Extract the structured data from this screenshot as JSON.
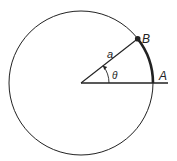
{
  "diagram": {
    "type": "circle-arc-angle",
    "labels": {
      "radius": "a",
      "angle": "θ",
      "point_b": "B",
      "point_a": "A"
    },
    "colors": {
      "stroke": "#222222",
      "background": "#ffffff"
    },
    "geometry": {
      "center": [
        81,
        83
      ],
      "radius": 72,
      "angle_deg": 38
    }
  }
}
